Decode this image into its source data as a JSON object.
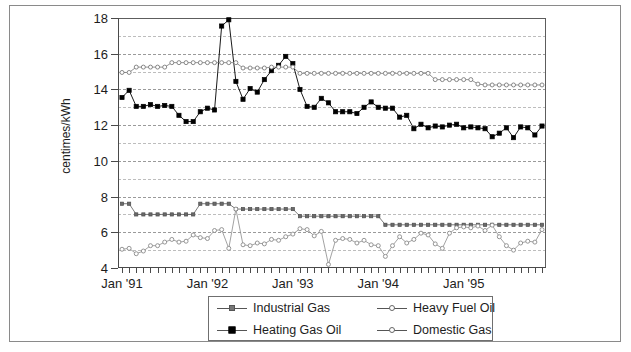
{
  "chart_data": {
    "type": "line",
    "title": "",
    "xlabel": "",
    "ylabel": "centimes/kWh",
    "ylim": [
      4,
      18
    ],
    "ytick_values": [
      4,
      6,
      8,
      10,
      12,
      14,
      16,
      18
    ],
    "ytick_labels": [
      "4",
      "6",
      "8",
      "10",
      "12",
      "14",
      "16",
      "18"
    ],
    "minor_gridlines": [
      5,
      7,
      9,
      11,
      13,
      15,
      17
    ],
    "grid": "horizontal-dashed",
    "legend_position": "below-center",
    "x_start": "1991-01",
    "x_end": "1995-12",
    "x_count": 60,
    "xtick_labels": [
      "Jan '91",
      "Jan '92",
      "Jan '93",
      "Jan '94",
      "Jan '95"
    ],
    "xtick_indices": [
      0,
      12,
      24,
      36,
      48
    ],
    "x_minor_tick_every": 1,
    "series": [
      {
        "name": "Industrial Gas",
        "marker": "filled-square-small",
        "color": "#595959",
        "values": [
          7.6,
          7.6,
          7.0,
          7.0,
          7.0,
          7.0,
          7.0,
          7.0,
          7.0,
          7.0,
          7.0,
          7.6,
          7.6,
          7.6,
          7.6,
          7.6,
          7.3,
          7.3,
          7.3,
          7.3,
          7.3,
          7.3,
          7.3,
          7.3,
          7.3,
          6.9,
          6.9,
          6.9,
          6.9,
          6.9,
          6.9,
          6.9,
          6.9,
          6.9,
          6.9,
          6.9,
          6.9,
          6.42,
          6.42,
          6.42,
          6.42,
          6.42,
          6.42,
          6.42,
          6.42,
          6.42,
          6.42,
          6.42,
          6.42,
          6.42,
          6.42,
          6.42,
          6.42,
          6.42,
          6.42,
          6.42,
          6.42,
          6.42,
          6.42,
          6.42
        ]
      },
      {
        "name": "Heating Gas Oil",
        "marker": "filled-square-large",
        "color": "#000000",
        "values": [
          13.55,
          13.95,
          13.05,
          13.05,
          13.15,
          13.05,
          13.1,
          13.05,
          12.55,
          12.2,
          12.2,
          12.75,
          12.95,
          12.85,
          17.55,
          17.9,
          14.45,
          13.45,
          14.05,
          13.85,
          14.55,
          15.05,
          15.35,
          15.85,
          15.45,
          14.0,
          13.05,
          13.0,
          13.5,
          13.25,
          12.75,
          12.75,
          12.75,
          12.65,
          13.0,
          13.3,
          13.0,
          12.95,
          12.95,
          12.45,
          12.55,
          11.8,
          12.05,
          11.85,
          11.95,
          11.9,
          12.0,
          12.05,
          11.85,
          11.9,
          11.85,
          11.8,
          11.35,
          11.55,
          11.85,
          11.3,
          11.9,
          11.85,
          11.45,
          11.95
        ]
      },
      {
        "name": "Heavy Fuel Oil",
        "marker": "open-circle",
        "color": "#7a7a7a",
        "values": [
          14.95,
          14.95,
          15.25,
          15.25,
          15.25,
          15.25,
          15.25,
          15.5,
          15.5,
          15.5,
          15.5,
          15.5,
          15.5,
          15.5,
          15.5,
          15.5,
          15.5,
          15.2,
          15.2,
          15.2,
          15.2,
          15.25,
          15.25,
          15.25,
          15.25,
          14.9,
          14.9,
          14.9,
          14.9,
          14.9,
          14.9,
          14.9,
          14.9,
          14.9,
          14.9,
          14.9,
          14.9,
          14.9,
          14.9,
          14.9,
          14.9,
          14.9,
          14.9,
          14.9,
          14.55,
          14.55,
          14.55,
          14.55,
          14.55,
          14.55,
          14.3,
          14.25,
          14.25,
          14.25,
          14.25,
          14.25,
          14.25,
          14.25,
          14.25,
          14.25
        ]
      },
      {
        "name": "Domestic Gas",
        "marker": "open-circle",
        "color": "#8a8a8a",
        "values": [
          5.05,
          5.1,
          4.8,
          4.95,
          5.25,
          5.25,
          5.45,
          5.6,
          5.45,
          5.5,
          5.85,
          5.7,
          5.65,
          6.1,
          6.15,
          5.1,
          7.3,
          5.3,
          5.25,
          5.4,
          5.35,
          5.6,
          5.55,
          5.75,
          5.9,
          6.2,
          6.15,
          5.8,
          6.05,
          4.2,
          5.55,
          5.65,
          5.6,
          5.4,
          5.55,
          5.3,
          5.25,
          4.65,
          5.25,
          5.75,
          5.4,
          5.6,
          5.95,
          5.85,
          5.35,
          5.1,
          5.95,
          6.25,
          6.3,
          6.25,
          6.35,
          6.1,
          6.4,
          5.75,
          5.25,
          5.0,
          5.4,
          5.5,
          5.45,
          6.15
        ]
      }
    ]
  },
  "legend": {
    "entries": [
      {
        "label": "Industrial Gas",
        "marker": "filled-square-small"
      },
      {
        "label": "Heavy Fuel Oil",
        "marker": "open-circle"
      },
      {
        "label": "Heating Gas Oil",
        "marker": "filled-square-large"
      },
      {
        "label": "Domestic Gas",
        "marker": "open-circle"
      }
    ]
  },
  "axis": {
    "y_title": "centimes/kWh"
  }
}
